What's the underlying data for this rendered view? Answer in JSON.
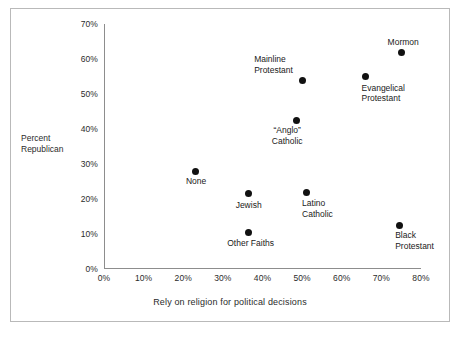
{
  "chart_data": {
    "type": "scatter",
    "title": "",
    "xlabel": "Rely on religion for political decisions",
    "ylabel": "Percent Republican",
    "ylabel_lines": [
      "Percent",
      "Republican"
    ],
    "xlim": [
      0,
      80
    ],
    "ylim": [
      0,
      70
    ],
    "xticks": [
      "0%",
      "10%",
      "20%",
      "30%",
      "40%",
      "50%",
      "60%",
      "70%",
      "80%"
    ],
    "xtick_values": [
      0,
      10,
      20,
      30,
      40,
      50,
      60,
      70,
      80
    ],
    "yticks": [
      "0%",
      "10%",
      "20%",
      "30%",
      "40%",
      "50%",
      "60%",
      "70%"
    ],
    "ytick_values": [
      0,
      10,
      20,
      30,
      40,
      50,
      60,
      70
    ],
    "grid": false,
    "legend": "none",
    "marker_color": "#111111",
    "axis_color": "#8d8d8d",
    "background": "#ffffff",
    "points": [
      {
        "label": "Mormon",
        "label_lines": [
          "Mormon"
        ],
        "x": 75.0,
        "y": 62.0,
        "label_align": "center",
        "label_dx": 2,
        "label_dy": -15
      },
      {
        "label": "Evangelical Protestant",
        "label_lines": [
          "Evangelical",
          "Protestant"
        ],
        "x": 66.0,
        "y": 55.0,
        "label_align": "right",
        "label_dx": -4,
        "label_dy": 6
      },
      {
        "label": "Mainline Protestant",
        "label_lines": [
          "Mainline",
          "Protestant"
        ],
        "x": 50.0,
        "y": 54.0,
        "label_align": "right",
        "label_dx": -48,
        "label_dy": -26
      },
      {
        "label": "“Anglo” Catholic",
        "label_lines": [
          "“Anglo”",
          "Catholic"
        ],
        "x": 48.5,
        "y": 42.5,
        "label_align": "center",
        "label_dx": -9,
        "label_dy": 5
      },
      {
        "label": "None",
        "label_lines": [
          "None"
        ],
        "x": 23.0,
        "y": 28.0,
        "label_align": "center",
        "label_dx": 1,
        "label_dy": 5
      },
      {
        "label": "Jewish",
        "label_lines": [
          "Jewish"
        ],
        "x": 36.5,
        "y": 21.5,
        "label_align": "center",
        "label_dx": 0,
        "label_dy": 6
      },
      {
        "label": "Latino Catholic",
        "label_lines": [
          "Latino",
          "Catholic"
        ],
        "x": 51.0,
        "y": 22.0,
        "label_align": "right",
        "label_dx": -4,
        "label_dy": 6
      },
      {
        "label": "Other Faiths",
        "label_lines": [
          "Other Faiths"
        ],
        "x": 36.5,
        "y": 10.5,
        "label_align": "center",
        "label_dx": 2,
        "label_dy": 6
      },
      {
        "label": "Black Protestant",
        "label_lines": [
          "Black",
          "Protestant"
        ],
        "x": 74.5,
        "y": 12.5,
        "label_align": "right",
        "label_dx": -4,
        "label_dy": 5
      }
    ]
  }
}
